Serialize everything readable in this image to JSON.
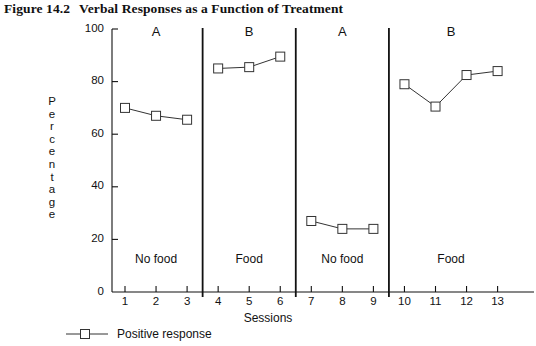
{
  "title": {
    "number": "Figure 14.2",
    "text": "Verbal Responses as a Function of Treatment"
  },
  "chart_data": {
    "type": "line",
    "xlabel": "Sessions",
    "ylabel": "Percentage",
    "xlim": [
      0.4,
      13.6
    ],
    "ylim": [
      0,
      100
    ],
    "grid": false,
    "legend_position": "below-left",
    "xticks": [
      1,
      2,
      3,
      4,
      5,
      6,
      7,
      8,
      9,
      10,
      11,
      12,
      13
    ],
    "xtick_labels": [
      "1",
      "2",
      "3",
      "4",
      "5",
      "6",
      "7",
      "8",
      "9",
      "10",
      "11",
      "12",
      "13"
    ],
    "yticks": [
      0,
      20,
      40,
      60,
      80,
      100
    ],
    "ytick_labels": [
      "0",
      "20",
      "40",
      "60",
      "80",
      "100"
    ],
    "marker": "open-square",
    "line_color": "#333333",
    "marker_color": "#333333",
    "series": [
      {
        "name": "Positive response",
        "x": [
          1,
          2,
          3,
          4,
          5,
          6,
          7,
          8,
          9,
          10,
          11,
          12,
          13
        ],
        "values": [
          70,
          67,
          65.5,
          85,
          85.5,
          89.5,
          27,
          24,
          24,
          79,
          70.5,
          82.5,
          84
        ],
        "segments": [
          [
            1,
            2,
            3
          ],
          [
            4,
            5,
            6
          ],
          [
            7,
            8,
            9
          ],
          [
            10,
            11,
            12,
            13
          ]
        ]
      }
    ],
    "phases": [
      {
        "letter": "A",
        "condition": "No food",
        "sessions": [
          1,
          3
        ]
      },
      {
        "letter": "B",
        "condition": "Food",
        "sessions": [
          4,
          6
        ]
      },
      {
        "letter": "A",
        "condition": "No food",
        "sessions": [
          7,
          9
        ]
      },
      {
        "letter": "B",
        "condition": "Food",
        "sessions": [
          10,
          13
        ]
      }
    ],
    "phase_dividers": [
      3.5,
      6.5,
      9.5
    ],
    "annotations": [
      "No food",
      "Food",
      "No food",
      "Food"
    ]
  },
  "legend": {
    "entries": [
      {
        "label": "Positive response",
        "marker": "open-square"
      }
    ]
  }
}
